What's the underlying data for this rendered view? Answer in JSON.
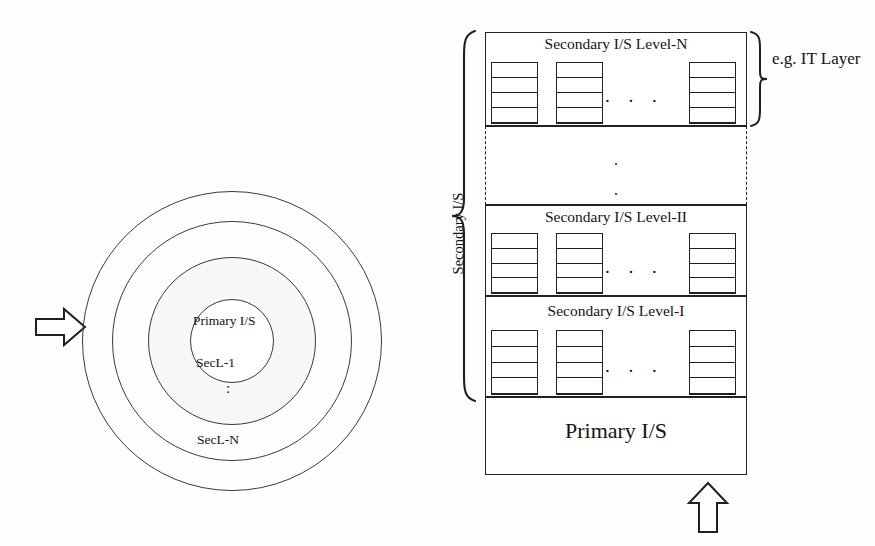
{
  "figure": {
    "ink_color": "#1a1a1a",
    "background_color": "#ffffff"
  },
  "onion": {
    "core_label": "Primary I/S",
    "ring_inner_label": "SecL-1",
    "ring_vertical_dots": ":",
    "ring_outer_label": "SecL-N",
    "input_arrow": "arrow-right"
  },
  "stack": {
    "levels": [
      {
        "id": "level-n",
        "title": "Secondary I/S Level-N",
        "shelf_dots": ". . .",
        "shelves": [
          {
            "rungs": 5
          },
          {
            "rungs": 5
          },
          {
            "rungs": 5
          }
        ]
      },
      {
        "id": "ellipsis",
        "title": "",
        "vertical_dots": [
          ".",
          "."
        ]
      },
      {
        "id": "level-ii",
        "title": "Secondary I/S Level-II",
        "shelf_dots": ". . .",
        "shelves": [
          {
            "rungs": 5
          },
          {
            "rungs": 5
          },
          {
            "rungs": 5
          }
        ]
      },
      {
        "id": "level-i",
        "title": "Secondary I/S Level-I",
        "shelf_dots": ". . .",
        "shelves": [
          {
            "rungs": 5
          },
          {
            "rungs": 5
          },
          {
            "rungs": 5
          }
        ]
      }
    ],
    "base_label": "Primary I/S",
    "input_arrow": "arrow-up"
  },
  "annotations": {
    "secondary_brace_label": "Secondary I/S",
    "it_layer_label": "e.g. IT Layer"
  }
}
